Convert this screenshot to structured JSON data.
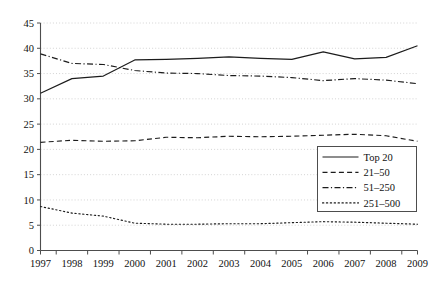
{
  "chart_data": {
    "type": "line",
    "title": "",
    "xlabel": "",
    "ylabel": "",
    "grid": true,
    "legend_position": "bottom-right",
    "x": [
      1997,
      1998,
      1999,
      2000,
      2001,
      2002,
      2003,
      2004,
      2005,
      2006,
      2007,
      2008,
      2009
    ],
    "categories": [
      "1997",
      "1998",
      "1999",
      "2000",
      "2001",
      "2002",
      "2003",
      "2004",
      "2005",
      "2006",
      "2007",
      "2008",
      "2009"
    ],
    "xlim": [
      1997,
      2009
    ],
    "ylim": [
      0,
      45
    ],
    "yticks": [
      0,
      5,
      10,
      15,
      20,
      25,
      30,
      35,
      40,
      45
    ],
    "ytick_labels": [
      "0",
      "5",
      "10",
      "15",
      "20",
      "25",
      "30",
      "35",
      "40",
      "45"
    ],
    "series": [
      {
        "name": "Top 20",
        "style": "solid",
        "color": "#1c1c1c",
        "values": [
          31.1,
          34.0,
          34.5,
          37.7,
          37.8,
          38.0,
          38.3,
          38.0,
          37.8,
          39.3,
          37.9,
          38.2,
          40.5
        ]
      },
      {
        "name": "21–50",
        "style": "dashed",
        "color": "#1c1c1c",
        "values": [
          21.4,
          21.8,
          21.6,
          21.7,
          22.4,
          22.3,
          22.6,
          22.5,
          22.6,
          22.8,
          23.0,
          22.7,
          21.6
        ]
      },
      {
        "name": "51–250",
        "style": "dash-dot",
        "color": "#1c1c1c",
        "values": [
          38.9,
          37.0,
          36.8,
          35.6,
          35.1,
          35.0,
          34.6,
          34.5,
          34.2,
          33.6,
          34.0,
          33.7,
          33.0
        ]
      },
      {
        "name": "251–500",
        "style": "dotted",
        "color": "#1c1c1c",
        "values": [
          8.7,
          7.4,
          6.8,
          5.4,
          5.2,
          5.2,
          5.3,
          5.3,
          5.5,
          5.7,
          5.6,
          5.4,
          5.2
        ]
      }
    ]
  },
  "legend": {
    "entries": [
      "Top 20",
      "21–50",
      "51–250",
      "251–500"
    ]
  },
  "axes": {
    "y_labels": [
      "45",
      "40",
      "35",
      "30",
      "25",
      "20",
      "15",
      "10",
      "5",
      "0"
    ],
    "x_labels": [
      "1997",
      "1998",
      "1999",
      "2000",
      "2001",
      "2002",
      "2003",
      "2004",
      "2005",
      "2006",
      "2007",
      "2008",
      "2009"
    ]
  }
}
